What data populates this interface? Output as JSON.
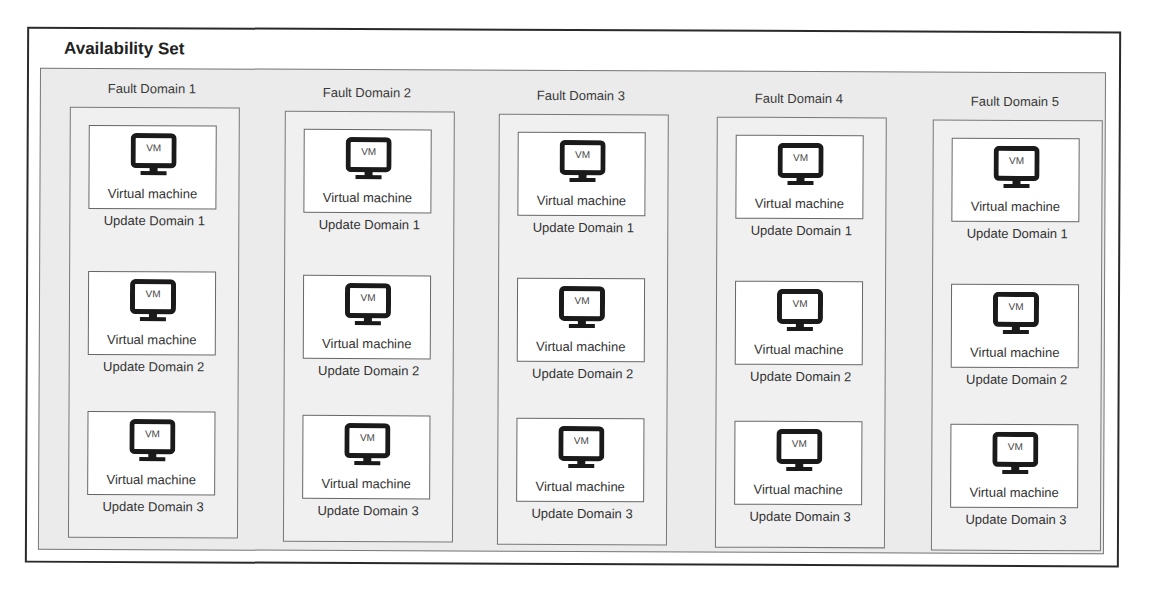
{
  "diagram": {
    "title": "Availability Set",
    "vm_icon_text": "VM",
    "vm_label": "Virtual machine",
    "colors": {
      "outer_border": "#2a2a2a",
      "inner_background": "#ebebeb",
      "box_border": "#777777",
      "vm_card_background": "#ffffff",
      "icon_fill": "#1a1a1a"
    },
    "fault_domains": [
      {
        "label": "Fault Domain 1",
        "update_domains": [
          {
            "vm_icon": "VM",
            "vm_label": "Virtual machine",
            "label": "Update Domain 1"
          },
          {
            "vm_icon": "VM",
            "vm_label": "Virtual machine",
            "label": "Update Domain 2"
          },
          {
            "vm_icon": "VM",
            "vm_label": "Virtual machine",
            "label": "Update Domain 3"
          }
        ]
      },
      {
        "label": "Fault Domain 2",
        "update_domains": [
          {
            "vm_icon": "VM",
            "vm_label": "Virtual machine",
            "label": "Update Domain 1"
          },
          {
            "vm_icon": "VM",
            "vm_label": "Virtual machine",
            "label": "Update Domain 2"
          },
          {
            "vm_icon": "VM",
            "vm_label": "Virtual machine",
            "label": "Update Domain 3"
          }
        ]
      },
      {
        "label": "Fault Domain 3",
        "update_domains": [
          {
            "vm_icon": "VM",
            "vm_label": "Virtual machine",
            "label": "Update Domain 1"
          },
          {
            "vm_icon": "VM",
            "vm_label": "Virtual machine",
            "label": "Update Domain 2"
          },
          {
            "vm_icon": "VM",
            "vm_label": "Virtual machine",
            "label": "Update Domain 3"
          }
        ]
      },
      {
        "label": "Fault Domain 4",
        "update_domains": [
          {
            "vm_icon": "VM",
            "vm_label": "Virtual machine",
            "label": "Update Domain 1"
          },
          {
            "vm_icon": "VM",
            "vm_label": "Virtual machine",
            "label": "Update Domain 2"
          },
          {
            "vm_icon": "VM",
            "vm_label": "Virtual machine",
            "label": "Update Domain 3"
          }
        ]
      },
      {
        "label": "Fault Domain 5",
        "update_domains": [
          {
            "vm_icon": "VM",
            "vm_label": "Virtual machine",
            "label": "Update Domain 1"
          },
          {
            "vm_icon": "VM",
            "vm_label": "Virtual machine",
            "label": "Update Domain 2"
          },
          {
            "vm_icon": "VM",
            "vm_label": "Virtual machine",
            "label": "Update Domain 3"
          }
        ]
      }
    ]
  }
}
